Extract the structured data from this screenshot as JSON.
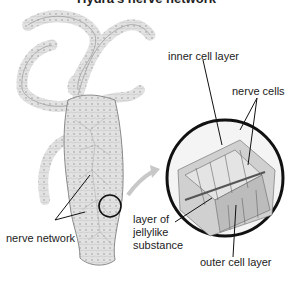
{
  "diagram": {
    "title": "Hydra's nerve network",
    "labels": {
      "inner_cell_layer": "inner cell layer",
      "nerve_cells": "nerve cells",
      "nerve_network": "nerve network",
      "jelly_line1": "layer of",
      "jelly_line2": "jellylike",
      "jelly_line3": "substance",
      "outer_cell_layer": "outer cell layer"
    },
    "colors": {
      "body_fill": "#dcdcdc",
      "body_stroke": "#8a8a8a",
      "circle_stroke": "#111111",
      "arrow": "#bfbfbf",
      "cell_fill": "#c8c8c8"
    }
  }
}
